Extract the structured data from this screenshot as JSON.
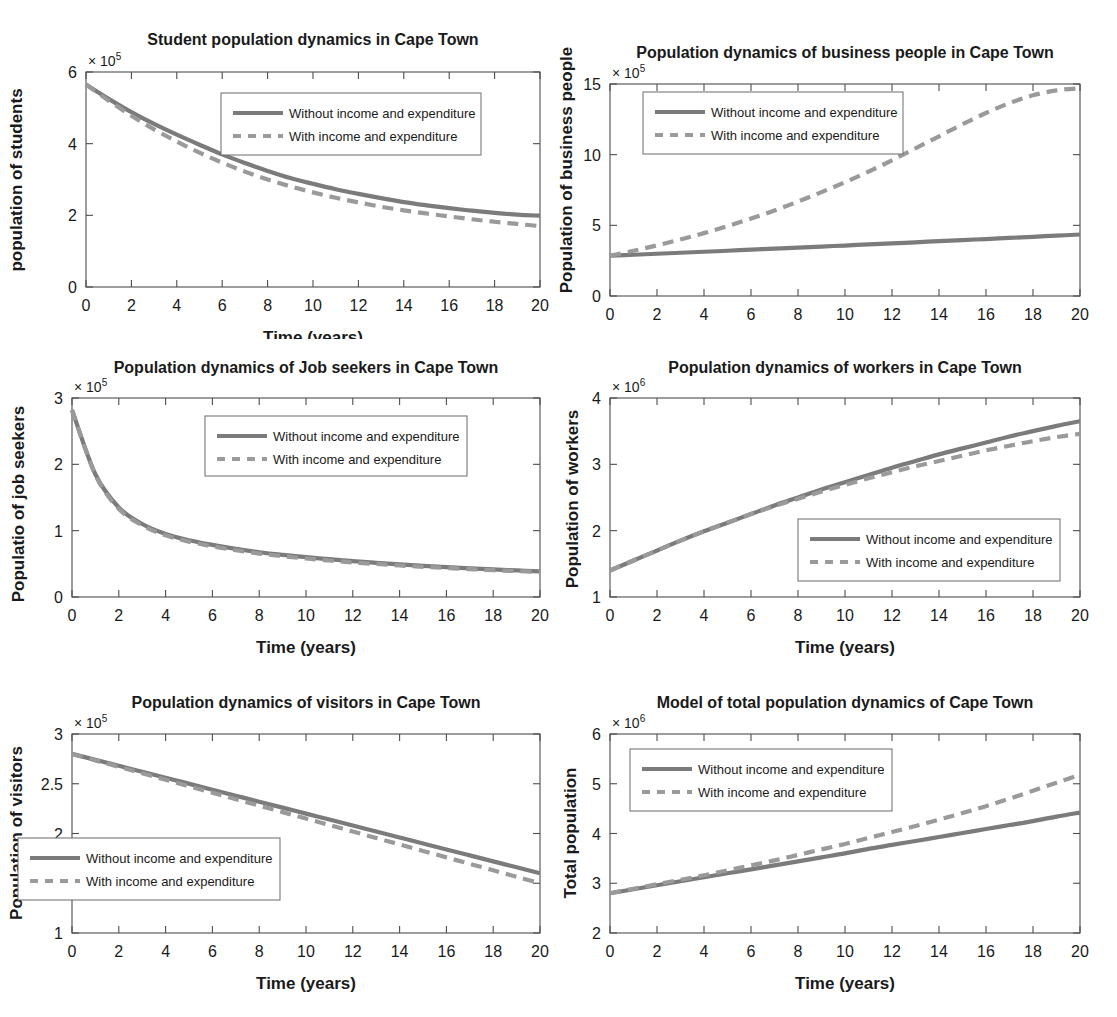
{
  "figure": {
    "background": "#ffffff",
    "series_colors": {
      "without": "#7b7b7b",
      "with": "#9a9a9a"
    },
    "legend_labels": {
      "without": "Without income and expenditure",
      "with": "With income and expenditure"
    },
    "xlabel": "Time (years)",
    "xticks": [
      "0",
      "2",
      "4",
      "6",
      "8",
      "10",
      "12",
      "14",
      "16",
      "18",
      "20"
    ]
  },
  "chart_data": [
    {
      "type": "line",
      "id": "students",
      "title": "Student population dynamics in Cape Town",
      "xlabel": "Time (years)",
      "ylabel": "population of students",
      "exponent_base": "× 10",
      "exponent_power": "5",
      "xlim": [
        0,
        20
      ],
      "ylim": [
        0,
        6
      ],
      "xticks": [
        0,
        2,
        4,
        6,
        8,
        10,
        12,
        14,
        16,
        18,
        20
      ],
      "yticks": [
        0,
        2,
        4,
        6
      ],
      "ytick_labels": [
        "0",
        "2",
        "4",
        "6"
      ],
      "grid": false,
      "legend_position": "top-right-inside",
      "x": [
        0,
        1,
        2,
        3,
        4,
        5,
        6,
        7,
        8,
        9,
        10,
        11,
        12,
        13,
        14,
        15,
        16,
        17,
        18,
        19,
        20
      ],
      "series": [
        {
          "name": "Without income and expenditure",
          "style": "solid",
          "values": [
            5.65,
            5.25,
            4.88,
            4.55,
            4.25,
            3.97,
            3.7,
            3.46,
            3.24,
            3.04,
            2.88,
            2.73,
            2.6,
            2.48,
            2.37,
            2.28,
            2.2,
            2.13,
            2.07,
            2.02,
            1.99
          ]
        },
        {
          "name": "With income and expenditure",
          "style": "dashed",
          "values": [
            5.65,
            5.2,
            4.78,
            4.4,
            4.06,
            3.75,
            3.47,
            3.22,
            3.0,
            2.81,
            2.64,
            2.49,
            2.36,
            2.24,
            2.14,
            2.05,
            1.97,
            1.89,
            1.82,
            1.76,
            1.7
          ]
        }
      ]
    },
    {
      "type": "line",
      "id": "business-people",
      "title": "Population dynamics of business people in Cape Town",
      "xlabel": "Time (years)",
      "ylabel": "Population of business people",
      "exponent_base": "× 10",
      "exponent_power": "5",
      "xlim": [
        0,
        20
      ],
      "ylim": [
        0,
        15
      ],
      "xticks": [
        0,
        2,
        4,
        6,
        8,
        10,
        12,
        14,
        16,
        18,
        20
      ],
      "yticks": [
        0,
        5,
        10,
        15
      ],
      "ytick_labels": [
        "0",
        "5",
        "10",
        "15"
      ],
      "grid": false,
      "legend_position": "top-left-inside",
      "x": [
        0,
        1,
        2,
        3,
        4,
        5,
        6,
        7,
        8,
        9,
        10,
        11,
        12,
        13,
        14,
        15,
        16,
        17,
        18,
        19,
        20
      ],
      "series": [
        {
          "name": "Without income and expenditure",
          "style": "solid",
          "values": [
            2.85,
            2.92,
            2.99,
            3.06,
            3.13,
            3.2,
            3.28,
            3.35,
            3.42,
            3.5,
            3.57,
            3.65,
            3.72,
            3.8,
            3.88,
            3.96,
            4.03,
            4.11,
            4.19,
            4.27,
            4.35
          ]
        },
        {
          "name": "With income and expenditure",
          "style": "dashed",
          "values": [
            2.85,
            3.2,
            3.58,
            4.0,
            4.45,
            4.95,
            5.48,
            6.05,
            6.68,
            7.35,
            8.05,
            8.8,
            9.6,
            10.45,
            11.3,
            12.15,
            12.95,
            13.65,
            14.2,
            14.55,
            14.7
          ]
        }
      ]
    },
    {
      "type": "line",
      "id": "job-seekers",
      "title": "Population dynamics of Job seekers in Cape Town",
      "xlabel": "Time (years)",
      "ylabel": "Populatio of job seekers",
      "exponent_base": "× 10",
      "exponent_power": "5",
      "xlim": [
        0,
        20
      ],
      "ylim": [
        0,
        3
      ],
      "xticks": [
        0,
        2,
        4,
        6,
        8,
        10,
        12,
        14,
        16,
        18,
        20
      ],
      "yticks": [
        0,
        1,
        2,
        3
      ],
      "ytick_labels": [
        "0",
        "1",
        "2",
        "3"
      ],
      "grid": false,
      "legend_position": "top-right-inside",
      "x": [
        0,
        1,
        2,
        3,
        4,
        5,
        6,
        7,
        8,
        9,
        10,
        11,
        12,
        13,
        14,
        15,
        16,
        17,
        18,
        19,
        20
      ],
      "series": [
        {
          "name": "Without income and expenditure",
          "style": "solid",
          "values": [
            2.82,
            1.85,
            1.35,
            1.1,
            0.95,
            0.855,
            0.785,
            0.725,
            0.675,
            0.635,
            0.6,
            0.57,
            0.54,
            0.515,
            0.492,
            0.47,
            0.45,
            0.432,
            0.415,
            0.4,
            0.385
          ]
        },
        {
          "name": "With income and expenditure",
          "style": "dashed",
          "values": [
            2.82,
            1.84,
            1.33,
            1.08,
            0.93,
            0.835,
            0.765,
            0.705,
            0.655,
            0.615,
            0.58,
            0.55,
            0.522,
            0.498,
            0.475,
            0.455,
            0.437,
            0.42,
            0.404,
            0.39,
            0.376
          ]
        }
      ]
    },
    {
      "type": "line",
      "id": "workers",
      "title": "Population dynamics of workers in Cape Town",
      "xlabel": "Time (years)",
      "ylabel": "Population of workers",
      "exponent_base": "× 10",
      "exponent_power": "6",
      "xlim": [
        0,
        20
      ],
      "ylim": [
        1,
        4
      ],
      "xticks": [
        0,
        2,
        4,
        6,
        8,
        10,
        12,
        14,
        16,
        18,
        20
      ],
      "yticks": [
        1,
        2,
        3,
        4
      ],
      "ytick_labels": [
        "1",
        "2",
        "3",
        "4"
      ],
      "grid": false,
      "legend_position": "bottom-right-inside",
      "x": [
        0,
        1,
        2,
        3,
        4,
        5,
        6,
        7,
        8,
        9,
        10,
        11,
        12,
        13,
        14,
        15,
        16,
        17,
        18,
        19,
        20
      ],
      "series": [
        {
          "name": "Without income and expenditure",
          "style": "solid",
          "values": [
            1.4,
            1.55,
            1.7,
            1.85,
            1.99,
            2.12,
            2.25,
            2.38,
            2.5,
            2.62,
            2.73,
            2.84,
            2.95,
            3.05,
            3.15,
            3.24,
            3.33,
            3.42,
            3.5,
            3.58,
            3.65
          ]
        },
        {
          "name": "With income and expenditure",
          "style": "dashed",
          "values": [
            1.4,
            1.55,
            1.7,
            1.85,
            1.99,
            2.12,
            2.25,
            2.37,
            2.48,
            2.59,
            2.69,
            2.79,
            2.88,
            2.97,
            3.05,
            3.13,
            3.21,
            3.28,
            3.35,
            3.41,
            3.46
          ]
        }
      ]
    },
    {
      "type": "line",
      "id": "visitors",
      "title": "Population dynamics of visitors in Cape Town",
      "xlabel": "Time (years)",
      "ylabel": "Population of visitors",
      "exponent_base": "× 10",
      "exponent_power": "5",
      "xlim": [
        0,
        20
      ],
      "ylim": [
        1,
        3
      ],
      "xticks": [
        0,
        2,
        4,
        6,
        8,
        10,
        12,
        14,
        16,
        18,
        20
      ],
      "yticks": [
        1,
        1.5,
        2,
        2.5,
        3
      ],
      "ytick_labels": [
        "1",
        "1.5",
        "2",
        "2.5",
        "3"
      ],
      "grid": false,
      "legend_position": "mid-left-inside",
      "x": [
        0,
        1,
        2,
        3,
        4,
        5,
        6,
        7,
        8,
        9,
        10,
        11,
        12,
        13,
        14,
        15,
        16,
        17,
        18,
        19,
        20
      ],
      "series": [
        {
          "name": "Without income and expenditure",
          "style": "solid",
          "values": [
            2.8,
            2.74,
            2.68,
            2.62,
            2.56,
            2.5,
            2.44,
            2.38,
            2.32,
            2.26,
            2.2,
            2.14,
            2.08,
            2.02,
            1.96,
            1.9,
            1.84,
            1.78,
            1.72,
            1.66,
            1.6
          ]
        },
        {
          "name": "With income and expenditure",
          "style": "dashed",
          "values": [
            2.8,
            2.735,
            2.67,
            2.605,
            2.54,
            2.475,
            2.41,
            2.345,
            2.28,
            2.215,
            2.15,
            2.085,
            2.02,
            1.955,
            1.89,
            1.825,
            1.76,
            1.695,
            1.63,
            1.565,
            1.5
          ]
        }
      ]
    },
    {
      "type": "line",
      "id": "total-population",
      "title": "Model of total population dynamics of Cape Town",
      "xlabel": "Time (years)",
      "ylabel": "Total population",
      "exponent_base": "× 10",
      "exponent_power": "6",
      "xlim": [
        0,
        20
      ],
      "ylim": [
        2,
        6
      ],
      "xticks": [
        0,
        2,
        4,
        6,
        8,
        10,
        12,
        14,
        16,
        18,
        20
      ],
      "yticks": [
        2,
        3,
        4,
        5,
        6
      ],
      "ytick_labels": [
        "2",
        "3",
        "4",
        "5",
        "6"
      ],
      "grid": false,
      "legend_position": "top-left-inside",
      "x": [
        0,
        1,
        2,
        3,
        4,
        5,
        6,
        7,
        8,
        9,
        10,
        11,
        12,
        13,
        14,
        15,
        16,
        17,
        18,
        19,
        20
      ],
      "series": [
        {
          "name": "Without income and expenditure",
          "style": "solid",
          "values": [
            2.8,
            2.88,
            2.96,
            3.04,
            3.12,
            3.2,
            3.28,
            3.36,
            3.44,
            3.52,
            3.6,
            3.69,
            3.77,
            3.85,
            3.93,
            4.01,
            4.09,
            4.17,
            4.25,
            4.34,
            4.42
          ]
        },
        {
          "name": "With income and expenditure",
          "style": "dashed",
          "values": [
            2.8,
            2.89,
            2.98,
            3.07,
            3.16,
            3.26,
            3.36,
            3.46,
            3.57,
            3.68,
            3.79,
            3.91,
            4.03,
            4.15,
            4.28,
            4.41,
            4.55,
            4.7,
            4.86,
            5.02,
            5.18
          ]
        }
      ]
    }
  ]
}
